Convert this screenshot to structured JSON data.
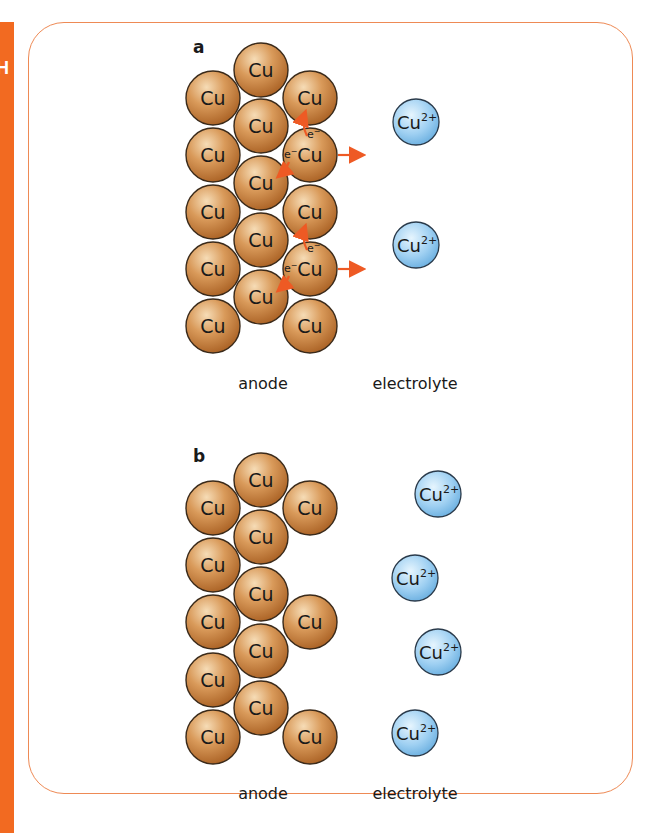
{
  "side_tab": {
    "letter": "H",
    "color": "#f26a21"
  },
  "frame": {
    "border_color": "#ee8a55"
  },
  "colors": {
    "copper_atom_fill": "#c47a35",
    "copper_atom_highlight": "#f3d2a6",
    "copper_ion_fill": "#8cc6ee",
    "copper_ion_highlight": "#e3f3fd",
    "arrow": "#ee5a24",
    "outline": "#3a2a1a"
  },
  "panels": [
    {
      "id": "a",
      "label": "a",
      "atom_label": "Cu",
      "atoms": [
        {
          "x": 213,
          "y": 98
        },
        {
          "x": 213,
          "y": 155
        },
        {
          "x": 213,
          "y": 212
        },
        {
          "x": 213,
          "y": 269
        },
        {
          "x": 213,
          "y": 326
        },
        {
          "x": 261,
          "y": 70
        },
        {
          "x": 261,
          "y": 126
        },
        {
          "x": 261,
          "y": 183
        },
        {
          "x": 261,
          "y": 240
        },
        {
          "x": 261,
          "y": 297
        },
        {
          "x": 310,
          "y": 98
        },
        {
          "x": 310,
          "y": 155
        },
        {
          "x": 310,
          "y": 212
        },
        {
          "x": 310,
          "y": 269
        },
        {
          "x": 310,
          "y": 326
        }
      ],
      "ions": [
        {
          "label": "Cu",
          "charge": "2+",
          "x": 416,
          "y": 122
        },
        {
          "label": "Cu",
          "charge": "2+",
          "x": 416,
          "y": 245
        }
      ],
      "electron_label": "e",
      "electron_charge": "−",
      "release_arrows_y": [
        155,
        269
      ],
      "region_labels": {
        "left": "anode",
        "right": "electrolyte"
      }
    },
    {
      "id": "b",
      "label": "b",
      "atom_label": "Cu",
      "atoms": [
        {
          "x": 213,
          "y": 508
        },
        {
          "x": 213,
          "y": 565
        },
        {
          "x": 213,
          "y": 622
        },
        {
          "x": 213,
          "y": 680
        },
        {
          "x": 213,
          "y": 737
        },
        {
          "x": 261,
          "y": 480
        },
        {
          "x": 261,
          "y": 537
        },
        {
          "x": 261,
          "y": 594
        },
        {
          "x": 261,
          "y": 651
        },
        {
          "x": 261,
          "y": 708
        },
        {
          "x": 310,
          "y": 508
        },
        {
          "x": 310,
          "y": 622
        },
        {
          "x": 310,
          "y": 737
        }
      ],
      "ions": [
        {
          "label": "Cu",
          "charge": "2+",
          "x": 438,
          "y": 494
        },
        {
          "label": "Cu",
          "charge": "2+",
          "x": 415,
          "y": 578
        },
        {
          "label": "Cu",
          "charge": "2+",
          "x": 438,
          "y": 652
        },
        {
          "label": "Cu",
          "charge": "2+",
          "x": 415,
          "y": 733
        }
      ],
      "region_labels": {
        "left": "anode",
        "right": "electrolyte"
      }
    }
  ]
}
